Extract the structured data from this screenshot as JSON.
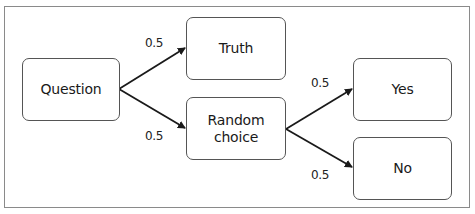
{
  "diagram": {
    "type": "probability-tree",
    "nodes": [
      {
        "id": "question",
        "label": "Question"
      },
      {
        "id": "truth",
        "label": "Truth"
      },
      {
        "id": "random_choice",
        "label": "Random\nchoice"
      },
      {
        "id": "yes",
        "label": "Yes"
      },
      {
        "id": "no",
        "label": "No"
      }
    ],
    "edges": [
      {
        "from": "question",
        "to": "truth",
        "label": "0.5"
      },
      {
        "from": "question",
        "to": "random_choice",
        "label": "0.5"
      },
      {
        "from": "random_choice",
        "to": "yes",
        "label": "0.5"
      },
      {
        "from": "random_choice",
        "to": "no",
        "label": "0.5"
      }
    ],
    "colors": {
      "stroke": "#1a1a1a",
      "border": "#555555",
      "frame": "#8a8a8a"
    }
  }
}
